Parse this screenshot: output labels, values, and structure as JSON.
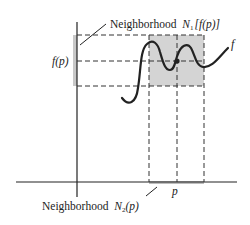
{
  "diagram": {
    "type": "continuity-neighborhood-illustration",
    "labels": {
      "top_neighborhood_word": "Neighborhood",
      "top_neighborhood_symbol": "N",
      "top_neighborhood_sub": "1",
      "top_neighborhood_arg": "[f(p)]",
      "bottom_neighborhood_word": "Neighborhood",
      "bottom_neighborhood_symbol": "N",
      "bottom_neighborhood_sub": "2",
      "bottom_neighborhood_arg": "(p)",
      "fp": "f(p)",
      "function": "f",
      "point": "p"
    },
    "colors": {
      "line": "#222222",
      "shade": "#d4d4d4",
      "background": "#ffffff"
    }
  }
}
